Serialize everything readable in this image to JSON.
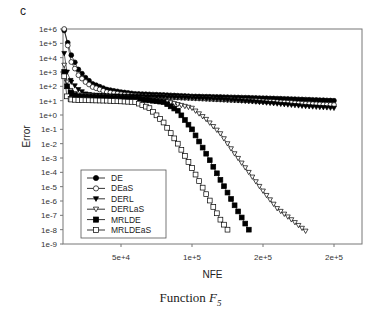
{
  "panel_label": "c",
  "caption": {
    "prefix": "Function ",
    "symbol": "F",
    "subscript": "5"
  },
  "chart_data": {
    "type": "scatter",
    "title": "",
    "xlabel": "NFE",
    "ylabel": "Error",
    "yscale": "log",
    "xlim": [
      9000,
      212000
    ],
    "ylim": [
      1e-09,
      1000000.0
    ],
    "grid": false,
    "legend_position": "lower-left",
    "x_ticks": [
      50000,
      100000,
      150000,
      200000
    ],
    "x_tick_labels": [
      "5e+4",
      "1e+5",
      "2e+5",
      "2e+5"
    ],
    "y_tick_labels": [
      "1e+6",
      "1e+5",
      "1e+4",
      "1e+3",
      "1e+2",
      "1e+1",
      "1e+0",
      "1e-1",
      "1e-2",
      "1e-3",
      "1e-4",
      "1e-5",
      "1e-6",
      "1e-7",
      "1e-8",
      "1e-9"
    ],
    "series": [
      {
        "name": "DE",
        "marker": "circle-filled",
        "x": [
          10000,
          15000,
          20000,
          25000,
          30000,
          40000,
          50000,
          60000,
          80000,
          100000,
          120000,
          140000,
          160000,
          180000,
          200000
        ],
        "y": [
          800000.0,
          15000.0,
          1500.0,
          400,
          150,
          60,
          40,
          30,
          25,
          20,
          18,
          16,
          14,
          12,
          10
        ]
      },
      {
        "name": "DEaS",
        "marker": "circle-open",
        "x": [
          10000,
          15000,
          20000,
          25000,
          30000,
          40000,
          50000,
          60000,
          80000,
          100000,
          120000,
          140000,
          160000,
          180000,
          200000
        ],
        "y": [
          1000000.0,
          5000.0,
          600,
          200,
          90,
          40,
          28,
          22,
          18,
          15,
          12,
          10,
          8,
          6,
          5
        ]
      },
      {
        "name": "DERL",
        "marker": "triangle-down-filled",
        "x": [
          10000,
          12000,
          15000,
          20000,
          25000,
          30000,
          40000,
          60000,
          80000,
          100000,
          120000,
          140000,
          160000,
          180000,
          200000
        ],
        "y": [
          20000.0,
          1000.0,
          200,
          60,
          30,
          25,
          22,
          20,
          18,
          15,
          12,
          9,
          6,
          4,
          3
        ]
      },
      {
        "name": "DERLaS",
        "marker": "triangle-down-open",
        "x": [
          10000,
          12000,
          15000,
          20000,
          40000,
          60000,
          80000,
          100000,
          110000,
          120000,
          130000,
          140000,
          150000,
          160000,
          170000,
          180000
        ],
        "y": [
          3000.0,
          200,
          40,
          25,
          20,
          15,
          10,
          3,
          0.5,
          0.05,
          0.002,
          0.0001,
          5e-06,
          3e-07,
          5e-08,
          8e-09
        ]
      },
      {
        "name": "MRLDE",
        "marker": "square-filled",
        "x": [
          10000,
          12000,
          15000,
          20000,
          40000,
          60000,
          80000,
          90000,
          100000,
          110000,
          120000,
          130000,
          140000
        ],
        "y": [
          1000.0,
          100,
          30,
          20,
          17,
          14,
          8,
          2,
          0.1,
          0.002,
          3e-05,
          5e-07,
          1e-08
        ]
      },
      {
        "name": "MRLDEaS",
        "marker": "square-open",
        "x": [
          10000,
          12000,
          15000,
          20000,
          40000,
          60000,
          70000,
          80000,
          90000,
          100000,
          110000,
          120000,
          125000
        ],
        "y": [
          500,
          20,
          12,
          11,
          10,
          8,
          3,
          0.3,
          0.01,
          0.0002,
          3e-06,
          5e-08,
          1e-08
        ]
      }
    ]
  }
}
